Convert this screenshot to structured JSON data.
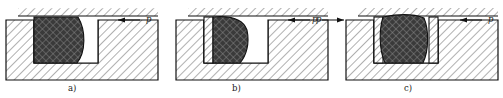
{
  "figure": {
    "type": "engineering-cross-section",
    "panel_count": 3,
    "pressure_symbol": "p",
    "colors": {
      "seal_fill": "#3a3a3a",
      "seal_crosshatch": "#8f8f8f",
      "body_hatch": "#6e6e6e",
      "backing_ring_fill": "#ffffff",
      "outline": "#111111",
      "background": "#ffffff",
      "gap_fill": "#ffffff"
    },
    "panels": [
      {
        "id": "a",
        "caption": "a)",
        "caption_x": 68,
        "caption_y": 90,
        "origin_x": 6,
        "seal_label": "o-ring-seal",
        "backing_rings": [],
        "arrows": [
          {
            "name": "pressure-arrow-right",
            "dir": "left",
            "x": 118,
            "y": 20,
            "len": 22,
            "label": "p",
            "label_x": 146,
            "label_y": 18
          }
        ]
      },
      {
        "id": "b",
        "caption": "b)",
        "caption_x": 232,
        "caption_y": 90,
        "origin_x": 172,
        "seal_label": "o-ring-seal",
        "backing_rings": [
          {
            "side": "left",
            "name": "backing-ring-left"
          }
        ],
        "arrows": [
          {
            "name": "pressure-arrow-right",
            "dir": "left",
            "x": 288,
            "y": 20,
            "len": 22,
            "label": "p",
            "label_x": 316,
            "label_y": 18
          }
        ]
      },
      {
        "id": "c",
        "caption": "c)",
        "caption_x": 404,
        "caption_y": 90,
        "origin_x": 344,
        "seal_label": "o-ring-seal",
        "backing_rings": [
          {
            "side": "left",
            "name": "backing-ring-left"
          },
          {
            "side": "right",
            "name": "backing-ring-right"
          }
        ],
        "arrows": [
          {
            "name": "pressure-arrow-left",
            "dir": "right",
            "x": 322,
            "y": 20,
            "len": 22,
            "label": "p",
            "label_x": 316,
            "label_y": 18
          },
          {
            "name": "pressure-arrow-right",
            "dir": "left",
            "x": 460,
            "y": 20,
            "len": 22,
            "label": "p",
            "label_x": 488,
            "label_y": 18
          }
        ]
      }
    ]
  }
}
